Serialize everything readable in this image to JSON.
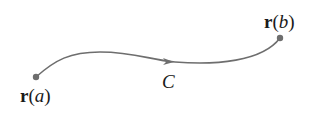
{
  "diagram": {
    "curve_name": "C",
    "start": {
      "vector": "r",
      "param": "a",
      "open": "(",
      "close": ")"
    },
    "end": {
      "vector": "r",
      "param": "b",
      "open": "(",
      "close": ")"
    },
    "colors": {
      "curve": "#6e6e6e",
      "point": "#6e6e6e",
      "text": "#1a1a1a"
    }
  }
}
